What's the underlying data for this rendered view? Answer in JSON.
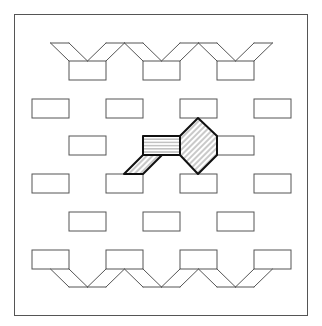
{
  "figure": {
    "frame": {
      "x": 14,
      "y": 14,
      "width": 294,
      "height": 302
    },
    "stroke_color": "#555555",
    "highlight_stroke_color": "#111111",
    "hatch_color": "#777777"
  },
  "grid": {
    "rect_width": 37,
    "rect_height": 19,
    "col_period": 74,
    "rows": [
      {
        "y": 61,
        "xs": [
          69,
          143,
          217
        ]
      },
      {
        "y": 99,
        "xs": [
          32,
          106,
          180,
          254
        ]
      },
      {
        "y": 136,
        "xs": [
          69,
          143,
          217
        ]
      },
      {
        "y": 174,
        "xs": [
          32,
          106,
          180,
          254
        ]
      },
      {
        "y": 212,
        "xs": [
          69,
          143,
          217
        ]
      },
      {
        "y": 250,
        "xs": [
          32,
          106,
          180,
          254
        ]
      }
    ],
    "top_edge_y": 43,
    "bottom_edge_y": 287
  },
  "highlight": {
    "rect": {
      "x": 143,
      "y": 136,
      "w": 37,
      "h": 19,
      "hatch": "horizontal"
    },
    "hexagon": {
      "points": [
        [
          198,
          118
        ],
        [
          217,
          136
        ],
        [
          217,
          155
        ],
        [
          198,
          174
        ],
        [
          180,
          155
        ],
        [
          180,
          136
        ]
      ],
      "hatch": "diagonal"
    },
    "parallelogram": {
      "points": [
        [
          143,
          155
        ],
        [
          162,
          155
        ],
        [
          143,
          174
        ],
        [
          124,
          174
        ]
      ],
      "hatch": "diagonal"
    }
  }
}
